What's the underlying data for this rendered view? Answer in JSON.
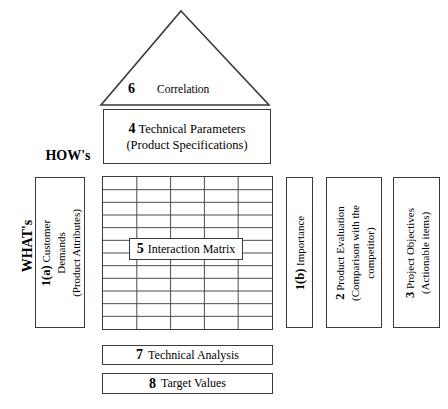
{
  "diagram": {
    "labels": {
      "hows": "HOW's",
      "whats": "WHAT's"
    },
    "roof": {
      "number": "6",
      "label": "Correlation"
    },
    "technical_parameters": {
      "number": "4",
      "line1": "Technical Parameters",
      "line2": "(Product Specifications)"
    },
    "customer_demands": {
      "number": "1(a)",
      "line1": "Customer",
      "line2": "Demands",
      "line3": "(Product Attributes)"
    },
    "interaction_matrix": {
      "number": "5",
      "label": "Interaction Matrix",
      "columns": 5,
      "rows": 12
    },
    "importance": {
      "number": "1(b)",
      "label": "Importance"
    },
    "product_evaluation": {
      "number": "2",
      "line1": "Product Evaluation",
      "line2": "(Comparison with the",
      "line3": "competitor)"
    },
    "project_objectives": {
      "number": "3",
      "line1": "Project Objectives",
      "line2": "(Actionable items)"
    },
    "technical_analysis": {
      "number": "7",
      "label": "Technical Analysis"
    },
    "target_values": {
      "number": "8",
      "label": "Target Values"
    },
    "colors": {
      "stroke": "#3a3a3a",
      "grid": "#4a4a4a",
      "background": "#ffffff",
      "text": "#000000"
    }
  }
}
